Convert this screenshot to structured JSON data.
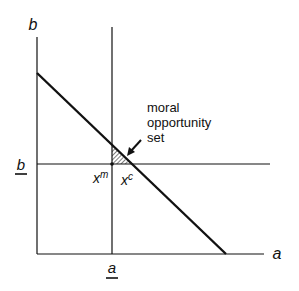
{
  "diagram": {
    "axes": {
      "y_label": "b",
      "x_label": "a"
    },
    "threshold_labels": {
      "b_bar": "b",
      "a_bar": "a"
    },
    "points": {
      "xm_base": "x",
      "xm_sup": "m",
      "xc_base": "x",
      "xc_sup": "c"
    },
    "annotation": {
      "line1": "moral",
      "line2": "opportunity",
      "line3": "set"
    },
    "colors": {
      "line": "#111111",
      "background": "#ffffff"
    }
  }
}
